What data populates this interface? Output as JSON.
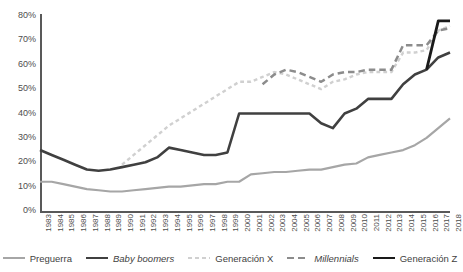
{
  "chart_data": {
    "type": "line",
    "title": "",
    "subtitle": "",
    "xlabel": "",
    "ylabel": "",
    "ylim": [
      0,
      80
    ],
    "yticks": [
      0,
      10,
      20,
      30,
      40,
      50,
      60,
      70,
      80
    ],
    "ytick_labels": [
      "0%",
      "10%",
      "20%",
      "30%",
      "40%",
      "50%",
      "60%",
      "70%",
      "80%"
    ],
    "grid": false,
    "legend_position": "bottom",
    "x": [
      1983,
      1984,
      1985,
      1986,
      1987,
      1988,
      1989,
      1990,
      1991,
      1992,
      1993,
      1994,
      1995,
      1996,
      1997,
      1998,
      1999,
      2000,
      2001,
      2002,
      2003,
      2004,
      2005,
      2006,
      2007,
      2008,
      2009,
      2010,
      2011,
      2012,
      2013,
      2014,
      2015,
      2016,
      2017,
      2018
    ],
    "xtick_labels": [
      "1983",
      "1984",
      "1985",
      "1986",
      "1987",
      "1988",
      "1989",
      "1990",
      "1991",
      "1992",
      "1993",
      "1994",
      "1995",
      "1996",
      "1997",
      "1998",
      "1999",
      "2000",
      "2001",
      "2002",
      "2003",
      "2004",
      "2005",
      "2006",
      "2007",
      "2008",
      "2009",
      "2010",
      "2011",
      "2012",
      "2013",
      "2014",
      "2015",
      "2016",
      "2017",
      "2018"
    ],
    "series": [
      {
        "name": "Preguerra",
        "color": "#a6a6a6",
        "style": "solid",
        "width": 2.2,
        "values": [
          12,
          12,
          11,
          10,
          9,
          8.5,
          8,
          8,
          8.5,
          9,
          9.5,
          10,
          10,
          10.5,
          11,
          11,
          12,
          12,
          15,
          15.5,
          16,
          16,
          16.5,
          17,
          17,
          18,
          19,
          19.5,
          22,
          23,
          24,
          25,
          27,
          30,
          34,
          38
        ]
      },
      {
        "name": "Baby boomers",
        "color": "#404040",
        "style": "solid",
        "width": 2.6,
        "italic": true,
        "values": [
          25,
          23,
          21,
          19,
          17,
          16.5,
          17,
          18,
          19,
          20,
          22,
          26,
          25,
          24,
          23,
          23,
          24,
          40,
          40,
          40,
          40,
          40,
          40,
          40,
          36,
          34,
          40,
          42,
          46,
          46,
          46,
          52,
          56,
          58,
          63,
          65
        ]
      },
      {
        "name": "Generación X",
        "color": "#d0d0d0",
        "style": "dotted",
        "width": 2.4,
        "values": [
          null,
          null,
          null,
          null,
          null,
          null,
          null,
          19,
          23,
          27,
          31,
          35,
          38,
          41,
          44,
          47,
          50,
          53,
          53,
          55,
          57,
          56,
          54,
          52,
          50,
          53,
          54,
          56,
          57,
          57,
          57,
          65,
          65,
          66,
          74,
          76
        ]
      },
      {
        "name": "Millennials",
        "color": "#8c8c8c",
        "style": "dashed",
        "width": 2.5,
        "italic": true,
        "values": [
          null,
          null,
          null,
          null,
          null,
          null,
          null,
          null,
          null,
          null,
          null,
          null,
          null,
          null,
          null,
          null,
          null,
          null,
          null,
          52,
          56,
          58,
          57,
          55,
          53,
          56,
          57,
          57,
          58,
          58,
          58,
          68,
          68,
          68,
          74,
          75
        ]
      },
      {
        "name": "Generación Z",
        "color": "#1a1a1a",
        "style": "solid",
        "width": 2.8,
        "values": [
          null,
          null,
          null,
          null,
          null,
          null,
          null,
          null,
          null,
          null,
          null,
          null,
          null,
          null,
          null,
          null,
          null,
          null,
          null,
          null,
          null,
          null,
          null,
          null,
          null,
          null,
          null,
          null,
          null,
          null,
          null,
          null,
          null,
          58,
          78,
          78
        ]
      }
    ]
  },
  "legend": {
    "items": [
      {
        "label": "Preguerra",
        "color": "#a6a6a6",
        "style": "solid",
        "italic": false
      },
      {
        "label": "Baby boomers",
        "color": "#404040",
        "style": "solid",
        "italic": true
      },
      {
        "label": "Generación X",
        "color": "#d0d0d0",
        "style": "dotted",
        "italic": false
      },
      {
        "label": "Millennials",
        "color": "#8c8c8c",
        "style": "dashed",
        "italic": true
      },
      {
        "label": "Generación Z",
        "color": "#1a1a1a",
        "style": "solid",
        "italic": false
      }
    ]
  }
}
